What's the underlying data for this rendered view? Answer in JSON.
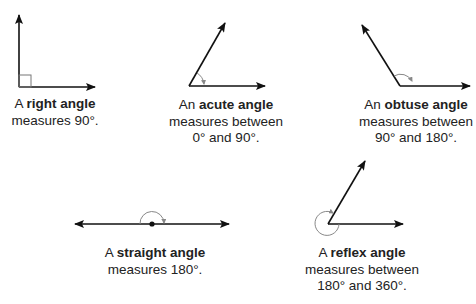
{
  "colors": {
    "line": "#111111",
    "arc": "#888888",
    "text": "#222222"
  },
  "angles": [
    {
      "id": "right",
      "prefix": "A",
      "name": "right angle",
      "line2": "measures 90°.",
      "line3": ""
    },
    {
      "id": "acute",
      "prefix": "An",
      "name": "acute angle",
      "line2": "measures between",
      "line3": "0° and 90°."
    },
    {
      "id": "obtuse",
      "prefix": "An",
      "name": "obtuse angle",
      "line2": "measures between",
      "line3": "90° and 180°."
    },
    {
      "id": "straight",
      "prefix": "A",
      "name": "straight angle",
      "line2": "measures 180°.",
      "line3": ""
    },
    {
      "id": "reflex",
      "prefix": "A",
      "name": "reflex angle",
      "line2": "measures between",
      "line3": "180° and 360°."
    }
  ]
}
